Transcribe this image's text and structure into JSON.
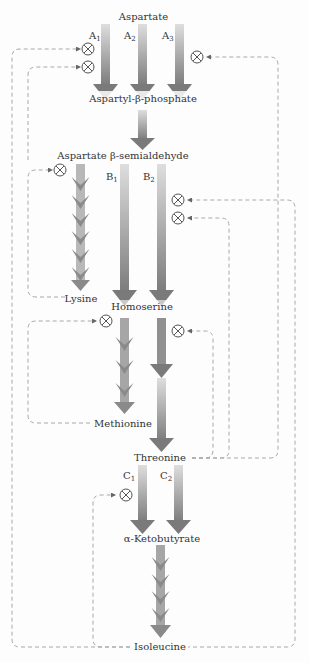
{
  "diagram": {
    "metabolites": {
      "aspartate": "Aspartate",
      "aspartyl_phosphate": "Aspartyl-β-phosphate",
      "semialdehyde": "Aspartate β-semialdehyde",
      "lysine": "Lysine",
      "homoserine": "Homoserine",
      "methionine": "Methionine",
      "threonine": "Threonine",
      "ketobutyrate": "α-Ketobutyrate",
      "isoleucine": "Isoleucine"
    },
    "enzymes": {
      "a1": {
        "letter": "A",
        "sub": "1"
      },
      "a2": {
        "letter": "A",
        "sub": "2"
      },
      "a3": {
        "letter": "A",
        "sub": "3"
      },
      "b1": {
        "letter": "B",
        "sub": "1"
      },
      "b2": {
        "letter": "B",
        "sub": "2"
      },
      "c1": {
        "letter": "C",
        "sub": "1"
      },
      "c2": {
        "letter": "C",
        "sub": "2"
      }
    },
    "inhibition_symbol": "⊗",
    "feedback": [
      {
        "from": "Threonine",
        "inhibits": "A1"
      },
      {
        "from": "Lysine",
        "inhibits": "A1"
      },
      {
        "from": "Methionine",
        "inhibits": "A3"
      },
      {
        "from": "Lysine",
        "inhibits": "Lysine branch"
      },
      {
        "from": "Isoleucine",
        "inhibits": "B2"
      },
      {
        "from": "Threonine",
        "inhibits": "B2"
      },
      {
        "from": "Methionine",
        "inhibits": "Methionine branch"
      },
      {
        "from": "Threonine",
        "inhibits": "Threonine branch"
      },
      {
        "from": "Isoleucine",
        "inhibits": "C1"
      }
    ],
    "colors": {
      "arrow_dark": "#7a7a7a",
      "arrow_light": "#d8d8d8",
      "feedback": "#a8a8a8"
    }
  }
}
